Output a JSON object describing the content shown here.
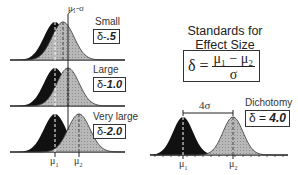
{
  "title": {
    "line1": "Standards for",
    "line2": "Effect Size"
  },
  "formula": {
    "lhs": "δ =",
    "numerator": "μ₁ − μ₂",
    "denominator": "σ"
  },
  "annotation": "μ₁-σ",
  "panels": [
    {
      "label": "Small",
      "delta_prefix": "δ-",
      "delta_value": ".5",
      "mu1_x": 55,
      "mu2_x": 63
    },
    {
      "label": "Large",
      "delta_prefix": "δ-",
      "delta_value": "1.0",
      "mu1_x": 55,
      "mu2_x": 68
    },
    {
      "label": "Very large",
      "delta_prefix": "δ-",
      "delta_value": "2.0",
      "mu1_x": 55,
      "mu2_x": 79
    }
  ],
  "dichotomy": {
    "label": "Dichotomy",
    "delta_prefix": "δ = ",
    "delta_value": "4.0",
    "distance_label": "4σ"
  },
  "axis_labels": {
    "mu1": "μ",
    "mu1_sub": "1",
    "mu2": "μ",
    "mu2_sub": "2"
  },
  "colors": {
    "group1": "#111111",
    "group2": "#b5b5b5",
    "line": "#222222"
  }
}
